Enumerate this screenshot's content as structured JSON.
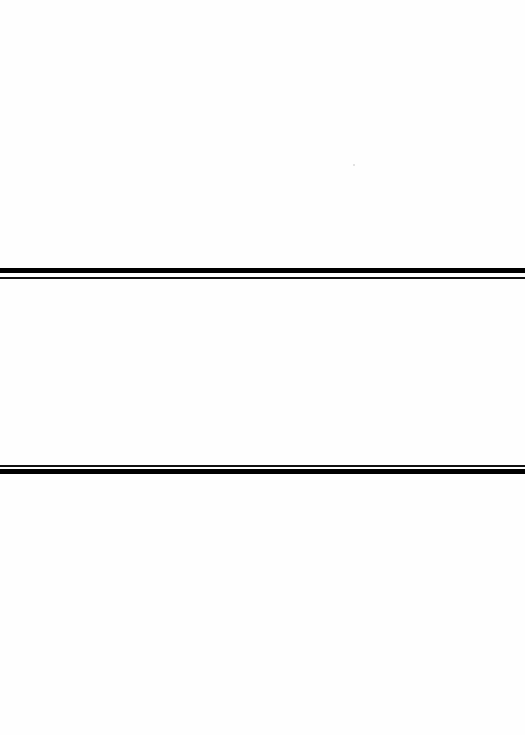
{
  "page": {
    "type": "blank scanned page",
    "background_color": "#ffffff",
    "rule_color": "#000000"
  },
  "separators": [
    {
      "name": "upper-double-rule",
      "order": [
        "thick",
        "thin"
      ]
    },
    {
      "name": "lower-double-rule",
      "order": [
        "thin",
        "thick"
      ]
    }
  ],
  "text": []
}
